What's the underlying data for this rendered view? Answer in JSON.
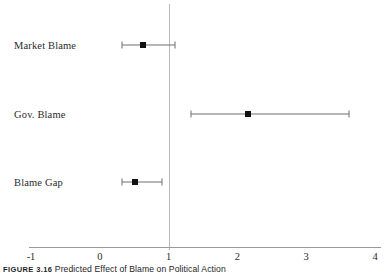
{
  "caption": {
    "figure_number": "FIGURE 3.16",
    "text": "Predicted Effect of Blame on Political Action"
  },
  "chart_data": {
    "type": "scatter",
    "subtype": "dot-and-whisker coefficient plot",
    "title": "Predicted Effect of Blame on Political Action",
    "xlabel": "",
    "ylabel": "",
    "xlim": [
      -1,
      4
    ],
    "xticks": [
      -1,
      0,
      1,
      2,
      3,
      4
    ],
    "xticklabels": [
      "-1",
      "0",
      "1",
      "2",
      "3",
      "4"
    ],
    "grid": false,
    "legend": false,
    "reference_line": {
      "x": 1,
      "orientation": "vertical",
      "color": "#b9b9b9"
    },
    "categories": [
      "Market Blame",
      "Gov. Blame",
      "Blame Gap"
    ],
    "series": [
      {
        "name": "Predicted effect (odds ratio)",
        "points": [
          {
            "category": "Market Blame",
            "estimate": 0.63,
            "ci_low": 0.32,
            "ci_high": 1.1
          },
          {
            "category": "Gov. Blame",
            "estimate": 2.15,
            "ci_low": 1.32,
            "ci_high": 3.62
          },
          {
            "category": "Blame Gap",
            "estimate": 0.51,
            "ci_low": 0.32,
            "ci_high": 0.9
          }
        ]
      }
    ],
    "colors": {
      "marker": "#111111",
      "whisker": "#6e6e6e",
      "axis": "#9a9a9a",
      "reference": "#b9b9b9",
      "background": "#ffffff"
    }
  }
}
